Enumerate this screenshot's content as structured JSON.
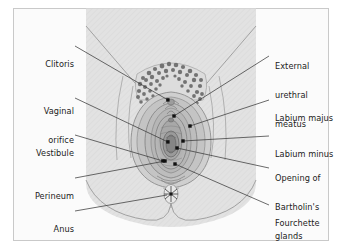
{
  "figure": {
    "background_color": "#fbfbfb",
    "frame_color": "#c9c9c9",
    "text_color": "#1c1c1c",
    "skin_fill": "#e2e2e2",
    "skin_stroke": "#9a9a9a",
    "labia_fill": "#c4c4c4",
    "vestibule_fill": "#b0b0b0",
    "hair_color": "#6b6b6b",
    "leader_color": "#3a3a3a",
    "marker_color": "#111111"
  },
  "labels": {
    "left": [
      {
        "id": "clitoris",
        "text": "Clitoris",
        "lines": [
          "Clitoris"
        ]
      },
      {
        "id": "vaginal-orifice",
        "text": "Vaginal orifice",
        "lines": [
          "Vaginal",
          "orifice"
        ]
      },
      {
        "id": "vestibule",
        "text": "Vestibule",
        "lines": [
          "Vestibule"
        ]
      },
      {
        "id": "perineum",
        "text": "Perineum",
        "lines": [
          "Perineum"
        ]
      },
      {
        "id": "anus",
        "text": "Anus",
        "lines": [
          "Anus"
        ]
      }
    ],
    "right": [
      {
        "id": "external-urethral-meatus",
        "text": "External urethral meatus",
        "lines": [
          "External",
          "urethral",
          "meatus"
        ]
      },
      {
        "id": "labium-majus",
        "text": "Labium majus",
        "lines": [
          "Labium majus"
        ]
      },
      {
        "id": "labium-minus",
        "text": "Labium minus",
        "lines": [
          "Labium minus"
        ]
      },
      {
        "id": "bartholins-glands",
        "text": "Opening of Bartholin's glands",
        "lines": [
          "Opening of",
          "Bartholin's",
          "glands"
        ]
      },
      {
        "id": "fourchette",
        "text": "Fourchette",
        "lines": [
          "Fourchette"
        ]
      }
    ]
  }
}
